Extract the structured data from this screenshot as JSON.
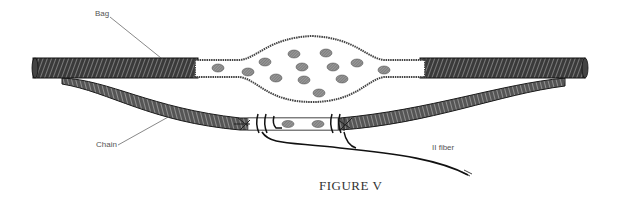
{
  "figure": {
    "caption": "FIGURE V",
    "labels": {
      "bag": "Bag",
      "chain": "Chain",
      "fiber": "II fiber"
    },
    "colors": {
      "ink": "#1a1a1a",
      "hatch": "#555555",
      "nucleus_fill": "#8a8a8a",
      "background": "#ffffff",
      "label_text": "#555555"
    },
    "bag_nuclei_count": 13,
    "chain_nuclei_count": 2
  }
}
